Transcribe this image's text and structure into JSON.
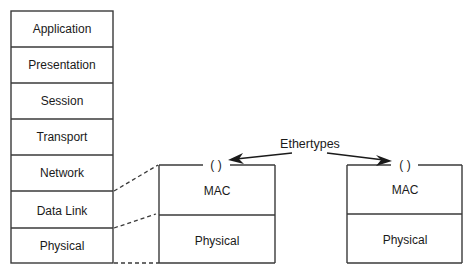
{
  "diagram": {
    "osi_stack": {
      "layers": [
        {
          "label": "Application"
        },
        {
          "label": "Presentation"
        },
        {
          "label": "Session"
        },
        {
          "label": "Transport"
        },
        {
          "label": "Network"
        },
        {
          "label": "Data Link"
        },
        {
          "label": "Physical"
        }
      ]
    },
    "ethernet_stacks": [
      {
        "ethertype_field": "( )",
        "upper_label": "MAC",
        "lower_label": "Physical"
      },
      {
        "ethertype_field": "( )",
        "upper_label": "MAC",
        "lower_label": "Physical"
      }
    ],
    "annotation": {
      "label": "Ethertypes"
    }
  }
}
